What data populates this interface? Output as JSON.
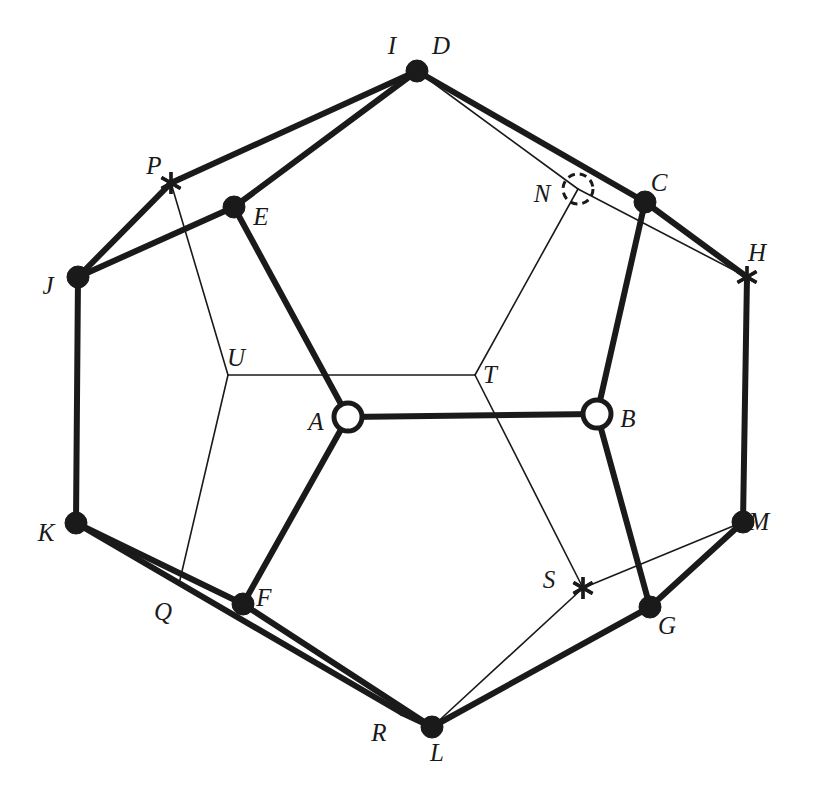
{
  "figure": {
    "title": "",
    "width": 817,
    "height": 798,
    "background_color": "#ffffff",
    "ink_color": "#1a1a1a"
  },
  "labels": {
    "I": "I",
    "D": "D",
    "P": "P",
    "E": "E",
    "N": "N",
    "C": "C",
    "J": "J",
    "H": "H",
    "U": "U",
    "T": "T",
    "A": "A",
    "B": "B",
    "K": "K",
    "M": "M",
    "Q": "Q",
    "F": "F",
    "S": "S",
    "G": "G",
    "R": "R",
    "L": "L"
  },
  "nodes": [
    {
      "id": "D",
      "label": "D",
      "marker": "filled-dot",
      "x": 417,
      "y": 71,
      "r": 11,
      "label_x": 441,
      "label_y": 48
    },
    {
      "id": "I",
      "label": "I",
      "marker": "label-only",
      "x": 394,
      "y": 71,
      "r": 0,
      "label_x": 392,
      "label_y": 48
    },
    {
      "id": "P",
      "label": "P",
      "marker": "asterisk",
      "x": 171,
      "y": 183,
      "r": 11,
      "label_x": 154,
      "label_y": 168
    },
    {
      "id": "E",
      "label": "E",
      "marker": "filled-dot",
      "x": 234,
      "y": 207,
      "r": 11,
      "label_x": 261,
      "label_y": 219
    },
    {
      "id": "N",
      "label": "N",
      "marker": "dashed-circle",
      "x": 578,
      "y": 189,
      "r": 15,
      "label_x": 542,
      "label_y": 196
    },
    {
      "id": "C",
      "label": "C",
      "marker": "filled-dot",
      "x": 645,
      "y": 202,
      "r": 11,
      "label_x": 659,
      "label_y": 185
    },
    {
      "id": "J",
      "label": "J",
      "marker": "filled-dot",
      "x": 78,
      "y": 277,
      "r": 11,
      "label_x": 48,
      "label_y": 288
    },
    {
      "id": "H",
      "label": "H",
      "marker": "asterisk",
      "x": 747,
      "y": 277,
      "r": 11,
      "label_x": 757,
      "label_y": 255
    },
    {
      "id": "U",
      "label": "U",
      "marker": "junction",
      "x": 228,
      "y": 375,
      "r": 0,
      "label_x": 236,
      "label_y": 360
    },
    {
      "id": "T",
      "label": "T",
      "marker": "junction",
      "x": 475,
      "y": 375,
      "r": 0,
      "label_x": 490,
      "label_y": 377
    },
    {
      "id": "A",
      "label": "A",
      "marker": "open-circle",
      "x": 348,
      "y": 417,
      "r": 14,
      "label_x": 316,
      "label_y": 424
    },
    {
      "id": "B",
      "label": "B",
      "marker": "open-circle",
      "x": 597,
      "y": 414,
      "r": 14,
      "label_x": 628,
      "label_y": 421
    },
    {
      "id": "K",
      "label": "K",
      "marker": "filled-dot",
      "x": 76,
      "y": 523,
      "r": 11,
      "label_x": 46,
      "label_y": 535
    },
    {
      "id": "M",
      "label": "M",
      "marker": "filled-dot",
      "x": 743,
      "y": 522,
      "r": 11,
      "label_x": 759,
      "label_y": 524
    },
    {
      "id": "S",
      "label": "S",
      "marker": "asterisk",
      "x": 583,
      "y": 588,
      "r": 11,
      "label_x": 549,
      "label_y": 582
    },
    {
      "id": "Q",
      "label": "Q",
      "marker": "junction",
      "x": 179,
      "y": 584,
      "r": 0,
      "label_x": 163,
      "label_y": 614
    },
    {
      "id": "F",
      "label": "F",
      "marker": "filled-dot",
      "x": 243,
      "y": 604,
      "r": 11,
      "label_x": 264,
      "label_y": 600
    },
    {
      "id": "G",
      "label": "G",
      "marker": "filled-dot",
      "x": 650,
      "y": 607,
      "r": 11,
      "label_x": 667,
      "label_y": 628
    },
    {
      "id": "R",
      "label": "R",
      "marker": "junction",
      "x": 402,
      "y": 713,
      "r": 0,
      "label_x": 379,
      "label_y": 735
    },
    {
      "id": "L",
      "label": "L",
      "marker": "filled-dot",
      "x": 432,
      "y": 727,
      "r": 11,
      "label_x": 437,
      "label_y": 755
    }
  ],
  "thick_edges": [
    {
      "from": "J",
      "to": "P",
      "x1": 78,
      "y1": 277,
      "x2": 171,
      "y2": 183
    },
    {
      "from": "P",
      "to": "D",
      "x1": 171,
      "y1": 183,
      "x2": 417,
      "y2": 71
    },
    {
      "from": "J",
      "to": "E",
      "x1": 78,
      "y1": 277,
      "x2": 234,
      "y2": 207
    },
    {
      "from": "E",
      "to": "D",
      "x1": 234,
      "y1": 207,
      "x2": 417,
      "y2": 71
    },
    {
      "from": "D",
      "to": "C",
      "x1": 417,
      "y1": 71,
      "x2": 645,
      "y2": 202
    },
    {
      "from": "C",
      "to": "H",
      "x1": 645,
      "y1": 202,
      "x2": 747,
      "y2": 277
    },
    {
      "from": "J",
      "to": "K",
      "x1": 78,
      "y1": 277,
      "x2": 76,
      "y2": 523
    },
    {
      "from": "H",
      "to": "M",
      "x1": 747,
      "y1": 277,
      "x2": 743,
      "y2": 522
    },
    {
      "from": "E",
      "to": "A",
      "x1": 234,
      "y1": 207,
      "x2": 348,
      "y2": 417
    },
    {
      "from": "C",
      "to": "B",
      "x1": 645,
      "y1": 202,
      "x2": 597,
      "y2": 414
    },
    {
      "from": "A",
      "to": "B",
      "x1": 348,
      "y1": 417,
      "x2": 597,
      "y2": 414
    },
    {
      "from": "A",
      "to": "F",
      "x1": 348,
      "y1": 417,
      "x2": 243,
      "y2": 604
    },
    {
      "from": "B",
      "to": "G",
      "x1": 597,
      "y1": 414,
      "x2": 650,
      "y2": 607
    },
    {
      "from": "K",
      "to": "F",
      "x1": 76,
      "y1": 523,
      "x2": 243,
      "y2": 604
    },
    {
      "from": "F",
      "to": "L",
      "x1": 243,
      "y1": 604,
      "x2": 432,
      "y2": 727
    },
    {
      "from": "K",
      "to": "R",
      "x1": 76,
      "y1": 523,
      "x2": 402,
      "y2": 713
    },
    {
      "from": "R",
      "to": "L",
      "x1": 402,
      "y1": 713,
      "x2": 432,
      "y2": 727
    },
    {
      "from": "L",
      "to": "G",
      "x1": 432,
      "y1": 727,
      "x2": 650,
      "y2": 607
    },
    {
      "from": "G",
      "to": "M",
      "x1": 650,
      "y1": 607,
      "x2": 743,
      "y2": 522
    }
  ],
  "thin_edges": [
    {
      "from": "D",
      "to": "N",
      "x1": 417,
      "y1": 71,
      "x2": 578,
      "y2": 189
    },
    {
      "from": "N",
      "to": "H",
      "x1": 578,
      "y1": 189,
      "x2": 747,
      "y2": 277
    },
    {
      "from": "P",
      "to": "U",
      "x1": 171,
      "y1": 183,
      "x2": 228,
      "y2": 375
    },
    {
      "from": "U",
      "to": "T",
      "x1": 228,
      "y1": 375,
      "x2": 475,
      "y2": 375
    },
    {
      "from": "U",
      "to": "Q",
      "x1": 228,
      "y1": 375,
      "x2": 179,
      "y2": 584
    },
    {
      "from": "N",
      "to": "T",
      "x1": 578,
      "y1": 189,
      "x2": 475,
      "y2": 375
    },
    {
      "from": "T",
      "to": "S",
      "x1": 475,
      "y1": 375,
      "x2": 583,
      "y2": 588
    },
    {
      "from": "L",
      "to": "S",
      "x1": 432,
      "y1": 727,
      "x2": 583,
      "y2": 588
    },
    {
      "from": "S",
      "to": "M",
      "x1": 583,
      "y1": 588,
      "x2": 743,
      "y2": 522
    },
    {
      "from": "Q",
      "to": "K",
      "x1": 179,
      "y1": 584,
      "x2": 76,
      "y2": 523
    },
    {
      "from": "R",
      "to": "L",
      "x1": 402,
      "y1": 713,
      "x2": 432,
      "y2": 727
    }
  ]
}
